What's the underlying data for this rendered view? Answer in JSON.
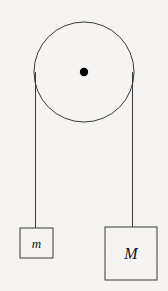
{
  "figure": {
    "kind": "physics-diagram",
    "canvas": {
      "width": 168,
      "height": 291
    },
    "background_color": "#f5f4f2",
    "ink_color": "#3a3a3a",
    "dot_color": "#000000"
  },
  "pulley": {
    "name": "pulley-wheel",
    "center_x": 84,
    "center_y": 72,
    "radius": 50,
    "stroke_width": 1,
    "axle": {
      "name": "pulley-axle-dot",
      "center_x": 84,
      "center_y": 72,
      "radius": 4.2
    }
  },
  "ropes": [
    {
      "name": "rope-left",
      "x": 35.5,
      "y_top": 72,
      "y_bottom": 228,
      "stroke_width": 1
    },
    {
      "name": "rope-right",
      "x": 132.5,
      "y_top": 72,
      "y_bottom": 227,
      "stroke_width": 1
    }
  ],
  "masses": [
    {
      "name": "mass-block-small",
      "label": "m",
      "x": 20,
      "y": 228,
      "width": 33,
      "height": 30,
      "label_x": 36.5,
      "label_y": 248,
      "stroke_width": 1
    },
    {
      "name": "mass-block-large",
      "label": "M",
      "x": 105,
      "y": 227,
      "width": 52,
      "height": 53,
      "label_x": 131,
      "label_y": 259,
      "stroke_width": 1
    }
  ]
}
